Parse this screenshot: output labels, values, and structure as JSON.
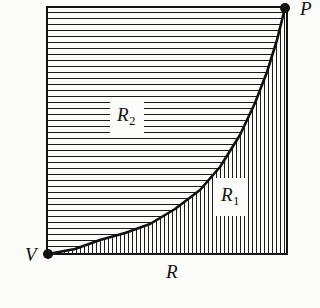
{
  "figure": {
    "kind": "math-region-diagram",
    "background_color": "#fbfbfa",
    "ink_color": "#111111",
    "hatch_color": "#1b1b1b",
    "labels": {
      "vertex_top_right": "P",
      "vertex_bottom_left": "V",
      "axis_horizontal": "R",
      "region_lower": "R",
      "region_lower_sub": "1",
      "region_upper": "R",
      "region_upper_sub": "2"
    },
    "frame": {
      "left_x": 47,
      "right_x": 287,
      "top_y": 7,
      "bottom_y": 254,
      "border_width": 2
    },
    "curve": {
      "description": "convex increasing curve from V to P",
      "points": [
        [
          48,
          254
        ],
        [
          75,
          249
        ],
        [
          100,
          240
        ],
        [
          125,
          233
        ],
        [
          150,
          224
        ],
        [
          175,
          209
        ],
        [
          200,
          190
        ],
        [
          220,
          167
        ],
        [
          240,
          135
        ],
        [
          255,
          103
        ],
        [
          267,
          72
        ],
        [
          277,
          40
        ],
        [
          285,
          8
        ]
      ],
      "stroke_width": 2.6
    },
    "hatching": {
      "region_lower_direction": "vertical",
      "region_lower_spacing_px": 4,
      "region_upper_direction": "horizontal",
      "region_upper_spacing_px": 6,
      "line_width": 1
    },
    "dots": [
      {
        "name": "vertex-dot-V",
        "x": 48,
        "y": 254,
        "r": 5
      },
      {
        "name": "vertex-dot-P",
        "x": 285,
        "y": 8,
        "r": 5
      }
    ]
  },
  "chart_data": {
    "type": "area",
    "title": "",
    "xlabel": "R",
    "ylabel": "",
    "grid": false,
    "legend": false,
    "annotations": [
      "P",
      "V",
      "R",
      "R₁",
      "R₂"
    ],
    "series": [
      {
        "name": "boundary-curve",
        "x": [
          0,
          0.112,
          0.217,
          0.321,
          0.429,
          0.529,
          0.633,
          0.717,
          0.8,
          0.862,
          0.912,
          0.954,
          1.0
        ],
        "y": [
          0,
          0.02,
          0.057,
          0.085,
          0.121,
          0.182,
          0.259,
          0.352,
          0.482,
          0.611,
          0.736,
          0.866,
          1.0
        ]
      }
    ],
    "regions": [
      {
        "label": "R₁",
        "fill": "vertical-hatch",
        "position": "below-curve"
      },
      {
        "label": "R₂",
        "fill": "horizontal-hatch",
        "position": "above-curve"
      }
    ],
    "xlim": [
      0,
      1
    ],
    "ylim": [
      0,
      1
    ]
  }
}
